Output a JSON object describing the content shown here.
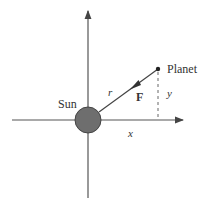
{
  "diagram": {
    "labels": {
      "sun": "Sun",
      "planet": "Planet",
      "r": "r",
      "force": "F",
      "x": "x",
      "y": "y"
    },
    "colors": {
      "axis": "#555555",
      "sun_fill": "#6e6e6e",
      "sun_stroke": "#444444",
      "text": "#333333",
      "force_vector": "#333333"
    },
    "elements": {
      "x_axis": {
        "x1": 12,
        "y1": 120,
        "x2": 184,
        "y2": 120
      },
      "y_axis": {
        "x1": 88,
        "y1": 198,
        "x2": 88,
        "y2": 10
      },
      "sun": {
        "cx": 88,
        "cy": 120,
        "r": 13
      },
      "planet": {
        "cx": 158,
        "cy": 69,
        "r": 2
      },
      "force_line": {
        "x1": 158,
        "y1": 69,
        "x2": 100,
        "y2": 111
      },
      "y_dashed": {
        "x1": 158,
        "y1": 72,
        "x2": 158,
        "y2": 120
      }
    }
  }
}
